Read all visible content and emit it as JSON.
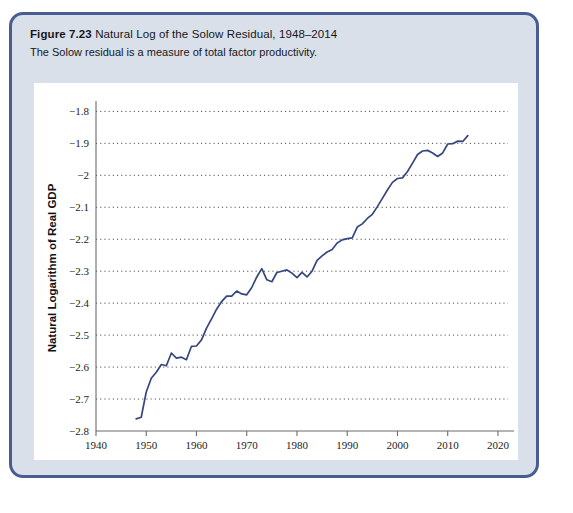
{
  "figure": {
    "number_label": "Figure 7.23",
    "title": "Natural Log of the Solow Residual, 1948–2014",
    "subtitle": "The Solow residual is a measure of total factor productivity.",
    "border_color": "#4a5d93",
    "header_background": "#d9e0ea",
    "panel_background": "#ffffff"
  },
  "chart_data": {
    "type": "line",
    "title": "Natural Log of the Solow Residual, 1948–2014",
    "xlabel": "Year",
    "ylabel": "Natural Logarithm of Real GDP",
    "xlim": [
      1940,
      2022
    ],
    "ylim": [
      -2.8,
      -1.78
    ],
    "xticks": [
      1940,
      1950,
      1960,
      1970,
      1980,
      1990,
      2000,
      2010,
      2020
    ],
    "xtick_labels": [
      "1940",
      "1950",
      "1960",
      "1970",
      "1980",
      "1990",
      "2000",
      "2010",
      "2020"
    ],
    "yticks": [
      -1.8,
      -1.9,
      -2.0,
      -2.1,
      -2.2,
      -2.3,
      -2.4,
      -2.5,
      -2.6,
      -2.7,
      -2.8
    ],
    "ytick_labels": [
      "−1.8",
      "−1.9",
      "−2",
      "−2.1",
      "−2.2",
      "−2.3",
      "−2.4",
      "−2.5",
      "−2.6",
      "−2.7",
      "−2.8"
    ],
    "grid": "horizontal-dotted",
    "legend": "none",
    "line_color": "#36477e",
    "series": [
      {
        "name": "Natural log of the Solow residual",
        "x": [
          1948,
          1949,
          1950,
          1951,
          1952,
          1953,
          1954,
          1955,
          1956,
          1957,
          1958,
          1959,
          1960,
          1961,
          1962,
          1963,
          1964,
          1965,
          1966,
          1967,
          1968,
          1969,
          1970,
          1971,
          1972,
          1973,
          1974,
          1975,
          1976,
          1977,
          1978,
          1979,
          1980,
          1981,
          1982,
          1983,
          1984,
          1985,
          1986,
          1987,
          1988,
          1989,
          1990,
          1991,
          1992,
          1993,
          1994,
          1995,
          1996,
          1997,
          1998,
          1999,
          2000,
          2001,
          2002,
          2003,
          2004,
          2005,
          2006,
          2007,
          2008,
          2009,
          2010,
          2011,
          2012,
          2013,
          2014
        ],
        "y": [
          -2.762,
          -2.757,
          -2.678,
          -2.635,
          -2.616,
          -2.592,
          -2.596,
          -2.556,
          -2.572,
          -2.569,
          -2.577,
          -2.535,
          -2.534,
          -2.515,
          -2.478,
          -2.449,
          -2.419,
          -2.395,
          -2.378,
          -2.378,
          -2.362,
          -2.371,
          -2.374,
          -2.351,
          -2.318,
          -2.292,
          -2.327,
          -2.333,
          -2.304,
          -2.3,
          -2.296,
          -2.306,
          -2.32,
          -2.304,
          -2.318,
          -2.3,
          -2.266,
          -2.252,
          -2.24,
          -2.232,
          -2.212,
          -2.202,
          -2.198,
          -2.196,
          -2.162,
          -2.152,
          -2.135,
          -2.122,
          -2.098,
          -2.072,
          -2.046,
          -2.022,
          -2.01,
          -2.008,
          -1.988,
          -1.962,
          -1.935,
          -1.924,
          -1.922,
          -1.93,
          -1.941,
          -1.93,
          -1.902,
          -1.901,
          -1.893,
          -1.894,
          -1.876
        ]
      }
    ]
  }
}
